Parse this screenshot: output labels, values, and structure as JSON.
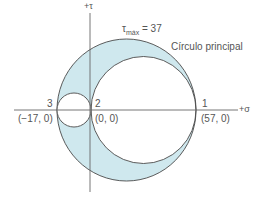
{
  "diagram": {
    "axes": {
      "sigma_label": "+σ",
      "tau_label": "+τ"
    },
    "tau_max": {
      "symbol": "τ",
      "subscript": "máx",
      "equals": "= 37"
    },
    "principal_circle_label": "Círculo principal",
    "points": [
      {
        "id": "3",
        "coord": "(−17, 0)"
      },
      {
        "id": "2",
        "coord": "(0, 0)"
      },
      {
        "id": "1",
        "coord": "(57, 0)"
      }
    ],
    "colors": {
      "fill": "#cfe8ee",
      "stroke": "#4a4a4a",
      "text": "#555555",
      "axis": "#555555"
    }
  }
}
